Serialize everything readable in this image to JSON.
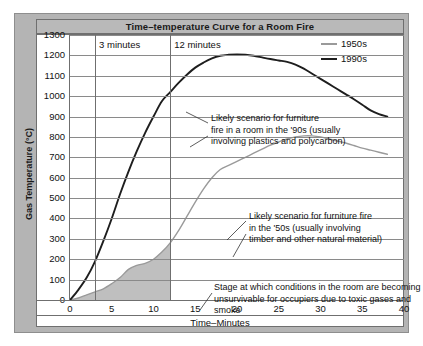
{
  "chart_data": {
    "type": "line",
    "title": "Time–temperature Curve for a Room Fire",
    "xlabel": "Time–Minutes",
    "ylabel": "Gas Temperature (°C)",
    "xlim": [
      0,
      40
    ],
    "ylim": [
      0,
      1300
    ],
    "xticks": [
      0,
      5,
      10,
      15,
      20,
      25,
      30,
      35,
      40
    ],
    "yticks": [
      0,
      100,
      200,
      300,
      400,
      500,
      600,
      700,
      800,
      900,
      1000,
      1100,
      1200,
      1300
    ],
    "grid": true,
    "legend_position": "top-right",
    "series": [
      {
        "name": "1950s",
        "color": "#9a9a9a",
        "points": [
          [
            0,
            0
          ],
          [
            1,
            10
          ],
          [
            2,
            25
          ],
          [
            3,
            40
          ],
          [
            4,
            55
          ],
          [
            5,
            80
          ],
          [
            6,
            110
          ],
          [
            7,
            150
          ],
          [
            8,
            170
          ],
          [
            9,
            180
          ],
          [
            10,
            200
          ],
          [
            11,
            235
          ],
          [
            12,
            280
          ],
          [
            13,
            340
          ],
          [
            14,
            410
          ],
          [
            15,
            480
          ],
          [
            16,
            545
          ],
          [
            17,
            600
          ],
          [
            18,
            640
          ],
          [
            19,
            660
          ],
          [
            20,
            680
          ],
          [
            21,
            700
          ],
          [
            22,
            720
          ],
          [
            23,
            740
          ],
          [
            24,
            760
          ],
          [
            25,
            775
          ],
          [
            26,
            790
          ],
          [
            27,
            800
          ],
          [
            28,
            805
          ],
          [
            29,
            805
          ],
          [
            30,
            800
          ],
          [
            31,
            790
          ],
          [
            32,
            780
          ],
          [
            33,
            770
          ],
          [
            34,
            758
          ],
          [
            35,
            745
          ],
          [
            36,
            735
          ],
          [
            37,
            725
          ],
          [
            38,
            715
          ]
        ]
      },
      {
        "name": "1990s",
        "color": "#1e1e1e",
        "points": [
          [
            0,
            0
          ],
          [
            1,
            50
          ],
          [
            2,
            110
          ],
          [
            3,
            190
          ],
          [
            4,
            290
          ],
          [
            5,
            400
          ],
          [
            6,
            520
          ],
          [
            7,
            630
          ],
          [
            8,
            730
          ],
          [
            9,
            820
          ],
          [
            10,
            900
          ],
          [
            11,
            975
          ],
          [
            12,
            1020
          ],
          [
            13,
            1065
          ],
          [
            14,
            1105
          ],
          [
            15,
            1140
          ],
          [
            16,
            1165
          ],
          [
            17,
            1185
          ],
          [
            18,
            1198
          ],
          [
            19,
            1203
          ],
          [
            20,
            1205
          ],
          [
            21,
            1203
          ],
          [
            22,
            1198
          ],
          [
            23,
            1190
          ],
          [
            24,
            1182
          ],
          [
            25,
            1175
          ],
          [
            26,
            1168
          ],
          [
            27,
            1155
          ],
          [
            28,
            1135
          ],
          [
            29,
            1110
          ],
          [
            30,
            1085
          ],
          [
            31,
            1060
          ],
          [
            32,
            1035
          ],
          [
            33,
            1010
          ],
          [
            34,
            985
          ],
          [
            35,
            958
          ],
          [
            36,
            930
          ],
          [
            37,
            912
          ],
          [
            38,
            900
          ]
        ]
      }
    ],
    "shaded_region": {
      "label": "toxic-gas-buildup-area",
      "color": "#bfbfbf",
      "x_from": 0,
      "x_to": 12,
      "follows_series": "1950s"
    },
    "vertical_markers": [
      {
        "x": 3,
        "label": "3 minutes"
      },
      {
        "x": 12,
        "label": "12 minutes"
      }
    ],
    "annotations": [
      {
        "name": "annotation-1990s",
        "text": "Likely scenario for furniture\nfire in a room in the '90s (usually\ninvolving plastics and polycarbon)"
      },
      {
        "name": "annotation-1950s",
        "text": "Likely scenario for furniture fire\nin the '50s (usually involving\ntimber and other natural material)"
      },
      {
        "name": "annotation-untenable-stage",
        "text": "Stage at which conditions in the room are becoming\nunsurvivable for occupiers due to toxic gases and smoke"
      }
    ]
  },
  "colors": {
    "frame": "#b4b4b4",
    "title_bar": "#b9b9b9",
    "plot_background": "#ffffff",
    "gridline": "#8a8a8a",
    "axis": "#6f6f6f",
    "series_1950s": "#9a9a9a",
    "series_1990s": "#1e1e1e",
    "shaded_area": "#bfbfbf"
  },
  "ticks": {
    "y": [
      "1300",
      "1200",
      "1100",
      "1000",
      "900",
      "800",
      "700",
      "600",
      "500",
      "400",
      "300",
      "200",
      "100",
      "0"
    ],
    "x": [
      "0",
      "5",
      "10",
      "15",
      "20",
      "25",
      "30",
      "35",
      "40"
    ]
  },
  "legend": {
    "items": [
      {
        "label": "1950s",
        "color": "#9a9a9a"
      },
      {
        "label": "1990s",
        "color": "#1e1e1e"
      }
    ]
  },
  "markers": {
    "three_minutes": "3 minutes",
    "twelve_minutes": "12 minutes"
  }
}
